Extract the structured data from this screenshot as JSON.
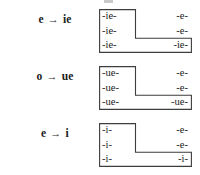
{
  "diagram": {
    "border_color": "#3d3d3d",
    "text_color": "#1b1b1b",
    "background": "#ffffff",
    "arrow_glyph": "→",
    "blocks": [
      {
        "label": {
          "from": "e",
          "arrow": "→",
          "to": "ie",
          "full": "e → ie"
        },
        "rows": [
          {
            "left": "-ie-",
            "right": "-e-"
          },
          {
            "left": "-ie-",
            "right": "-e-"
          },
          {
            "left": "-ie-",
            "right": "-ie-"
          }
        ]
      },
      {
        "label": {
          "from": "o",
          "arrow": "→",
          "to": "ue",
          "full": "o → ue"
        },
        "rows": [
          {
            "left": "-ue-",
            "right": "-e-"
          },
          {
            "left": "-ue-",
            "right": "-e-"
          },
          {
            "left": "-ue-",
            "right": "-ue-"
          }
        ]
      },
      {
        "label": {
          "from": "e",
          "arrow": "→",
          "to": "i",
          "full": "e → i"
        },
        "rows": [
          {
            "left": "-i-",
            "right": "-e-"
          },
          {
            "left": "-i-",
            "right": "-e-"
          },
          {
            "left": "-i-",
            "right": "-i-"
          }
        ]
      }
    ]
  }
}
